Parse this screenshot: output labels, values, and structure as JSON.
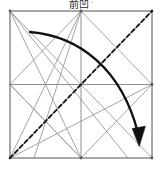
{
  "figure": {
    "kind": "origami-crease-pattern",
    "caption_text": "前凹",
    "step_mark": "◦",
    "canvas": {
      "width": 163,
      "height": 169
    },
    "colors": {
      "background": "#ffffff",
      "border": "#6f6f6f",
      "crease": "#9a9a9a",
      "mountain_dash": "#1a1a1a",
      "arrow": "#111111",
      "caption": "#2b2b2b"
    },
    "square": {
      "label": "paper-square",
      "left": 10,
      "top": 11,
      "right": 152,
      "bottom": 158,
      "width": 142,
      "height": 147,
      "stroke_width": 1.1
    },
    "center_point": {
      "x": 81,
      "y": 84.5
    },
    "grid_lines": [
      {
        "name": "vertical-midline",
        "x1": 81,
        "y1": 11,
        "x2": 81,
        "y2": 158
      },
      {
        "name": "horizontal-midline",
        "x1": 10,
        "y1": 84.5,
        "x2": 152,
        "y2": 84.5
      }
    ],
    "crease_lines": [
      {
        "name": "crease-tl-to-center-diag-upper-left-quadrant",
        "x1": 10,
        "y1": 11,
        "x2": 81,
        "y2": 84.5
      },
      {
        "name": "crease-tr-to-center-upper-right-quadrant",
        "x1": 152,
        "y1": 11,
        "x2": 81,
        "y2": 84.5
      },
      {
        "name": "crease-bl-to-center-lower-left-quadrant",
        "x1": 10,
        "y1": 158,
        "x2": 81,
        "y2": 84.5
      },
      {
        "name": "crease-br-to-center-lower-right-quadrant",
        "x1": 152,
        "y1": 158,
        "x2": 81,
        "y2": 84.5
      },
      {
        "name": "crease-topmid-to-left-mid",
        "x1": 81,
        "y1": 11,
        "x2": 10,
        "y2": 84.5
      },
      {
        "name": "crease-topmid-to-right-mid",
        "x1": 81,
        "y1": 11,
        "x2": 152,
        "y2": 84.5
      },
      {
        "name": "crease-botmid-to-left-mid",
        "x1": 81,
        "y1": 158,
        "x2": 10,
        "y2": 84.5
      },
      {
        "name": "crease-botmid-to-right-mid",
        "x1": 81,
        "y1": 158,
        "x2": 152,
        "y2": 84.5
      },
      {
        "name": "crease-long-tl-to-botmid",
        "x1": 10,
        "y1": 11,
        "x2": 81,
        "y2": 158
      },
      {
        "name": "crease-long-topmid-to-bl",
        "x1": 81,
        "y1": 11,
        "x2": 10,
        "y2": 158
      },
      {
        "name": "crease-long-bl-to-rightmid",
        "x1": 10,
        "y1": 158,
        "x2": 152,
        "y2": 84.5
      },
      {
        "name": "crease-long-bl-to-topright",
        "x1": 10,
        "y1": 158,
        "x2": 152,
        "y2": 11
      },
      {
        "name": "crease-slant-leftmid-to-botmid",
        "x1": 10,
        "y1": 84.5,
        "x2": 81,
        "y2": 158
      },
      {
        "name": "crease-slant-tl-to-center-long",
        "x1": 10,
        "y1": 11,
        "x2": 128,
        "y2": 158
      },
      {
        "name": "crease-slant-topmid-to-bottomleftish",
        "x1": 81,
        "y1": 11,
        "x2": 34,
        "y2": 158
      }
    ],
    "mountain_fold": {
      "name": "mountain-fold-dashed-diagonal",
      "from": {
        "x": 10,
        "y": 158
      },
      "to": {
        "x": 152,
        "y": 11
      },
      "style": "dashed",
      "dash_pattern": "4 3",
      "stroke_width": 1.8
    },
    "fold_arrow": {
      "name": "fold-direction-arrow",
      "description": "curved arrow sweeping from upper-left area to lower-right corner",
      "start": {
        "x": 30,
        "y": 32
      },
      "control": {
        "x": 112,
        "y": 52
      },
      "end": {
        "x": 141,
        "y": 142
      },
      "stroke_width": 2.2,
      "arrowhead": "solid-triangle-down"
    }
  }
}
